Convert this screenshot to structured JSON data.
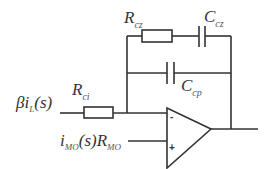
{
  "diagram": {
    "type": "op-amp compensator circuit",
    "components": {
      "r_cz": {
        "symbol": "R",
        "subscript": "cz"
      },
      "c_cz": {
        "symbol": "C",
        "subscript": "cz"
      },
      "c_cp": {
        "symbol": "C",
        "subscript": "cp"
      },
      "r_ci": {
        "symbol": "R",
        "subscript": "ci"
      }
    },
    "inputs": {
      "inverting_source": {
        "prefix": "βi",
        "subscript": "L",
        "suffix": "(s)"
      },
      "noninverting_source": {
        "part1": "i",
        "sub1": "MO",
        "part2": "(s)R",
        "sub2": "MO"
      }
    },
    "opamp": {
      "minus_label": "-",
      "plus_label": "+"
    },
    "colors": {
      "stroke": "#333333",
      "background": "#ffffff"
    }
  }
}
